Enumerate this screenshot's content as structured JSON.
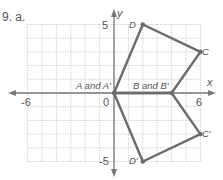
{
  "problem_label": "9. a.",
  "axes": {
    "x_label": "x",
    "y_label": "y",
    "x_ticks": [
      "-6",
      "6"
    ],
    "y_ticks": [
      "5",
      "-5"
    ],
    "origin_label": "0",
    "xlim": [
      -6,
      6
    ],
    "ylim": [
      -5,
      5
    ]
  },
  "colors": {
    "polygon": "#6b6b6b",
    "grid": "#c8c8c8",
    "axis": "#777777",
    "text": "#555555"
  },
  "points": {
    "A": {
      "label": "A and A'",
      "x": 0,
      "y": 0
    },
    "B": {
      "label": "B and B'",
      "x": 4,
      "y": 0
    },
    "C": {
      "label": "C",
      "x": 6,
      "y": 3
    },
    "D": {
      "label": "D",
      "x": 2,
      "y": 5
    },
    "C_prime": {
      "label": "C'",
      "x": 6,
      "y": -3
    },
    "D_prime": {
      "label": "D'",
      "x": 2,
      "y": -5
    }
  },
  "polygons": [
    {
      "name": "ABCD",
      "vertices": [
        "A",
        "B",
        "C",
        "D"
      ]
    },
    {
      "name": "A'B'C'D'",
      "vertices": [
        "A",
        "B",
        "C_prime",
        "D_prime"
      ]
    }
  ]
}
